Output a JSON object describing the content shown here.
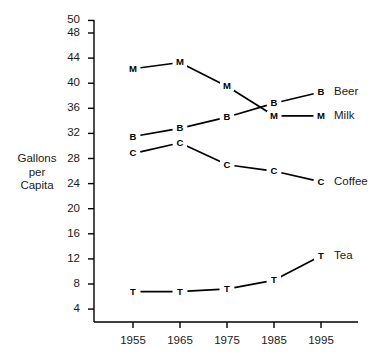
{
  "chart_data": {
    "type": "line",
    "title": "",
    "xlabel": "",
    "ylabel": "Gallons per Capita",
    "ylabel_lines": [
      "Gallons",
      "per",
      "Capita"
    ],
    "categories": [
      "1955",
      "1965",
      "1975",
      "1985",
      "1995"
    ],
    "x": [
      1955,
      1965,
      1975,
      1985,
      1995
    ],
    "xlim": [
      1950,
      2000
    ],
    "ylim": [
      2,
      50
    ],
    "yticks": [
      4,
      8,
      12,
      16,
      20,
      24,
      28,
      32,
      36,
      40,
      44,
      48,
      50
    ],
    "ytick_labels": [
      "4",
      "8",
      "12",
      "16",
      "20",
      "24",
      "28",
      "32",
      "36",
      "40",
      "44",
      "48",
      "50"
    ],
    "xticks": [
      1955,
      1965,
      1975,
      1985,
      1995
    ],
    "xtick_labels": [
      "1955",
      "1965",
      "1975",
      "1985",
      "1995"
    ],
    "grid": false,
    "legend_position": "right-inline",
    "series": [
      {
        "name": "Beer",
        "marker": "B",
        "label": "Beer",
        "values": [
          31.5,
          32.8,
          34.6,
          36.8,
          38.6
        ]
      },
      {
        "name": "Milk",
        "marker": "M",
        "label": "Milk",
        "values": [
          42.3,
          43.3,
          39.5,
          34.8,
          34.8
        ]
      },
      {
        "name": "Coffee",
        "marker": "C",
        "label": "Coffee",
        "values": [
          28.8,
          30.5,
          27.0,
          26.0,
          24.3
        ]
      },
      {
        "name": "Tea",
        "marker": "T",
        "label": "Tea",
        "values": [
          6.8,
          6.8,
          7.2,
          8.6,
          12.5
        ]
      }
    ],
    "colors": {
      "line": "#000000",
      "axis": "#000000",
      "text": "#1a1a1a",
      "background": "#ffffff"
    }
  }
}
